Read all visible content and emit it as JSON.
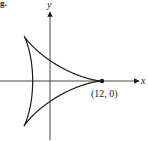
{
  "fragment_label": "g.",
  "axes": {
    "x_label": "x",
    "y_label": "y"
  },
  "point_label": "(12, 0)",
  "colors": {
    "stroke": "#1a1a1a",
    "axis": "#333333",
    "text": "#222222"
  },
  "chart_data": {
    "type": "line",
    "title": "",
    "xlabel": "x",
    "ylabel": "y",
    "curve": "deltoid (three-cusped hypocycloid)",
    "parametric": {
      "x": "8cos(t) + 4cos(2t)",
      "y": "8sin(t) - 4sin(2t)",
      "t_range": [
        0,
        6.2832
      ]
    },
    "cusps": [
      [
        12,
        0
      ],
      [
        -6,
        10.39
      ],
      [
        -6,
        -10.39
      ]
    ],
    "annotations": [
      {
        "text": "(12, 0)",
        "x": 12,
        "y": 0,
        "marker": "dot"
      }
    ],
    "grid": false,
    "legend": null
  }
}
